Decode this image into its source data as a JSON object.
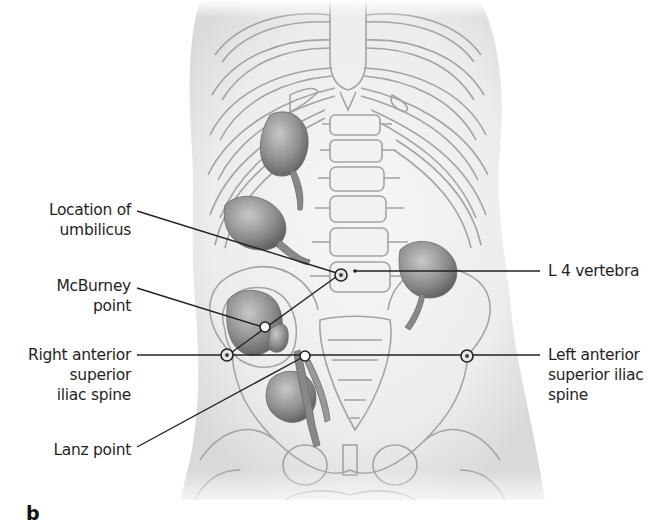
{
  "figure": {
    "panel_letter": "b",
    "labels_left": {
      "umbilicus": [
        "Location of",
        "umbilicus"
      ],
      "mcburney": [
        "McBurney",
        "point"
      ],
      "right_asis": [
        "Right anterior",
        "superior",
        "iliac spine"
      ],
      "lanz": [
        "Lanz point"
      ]
    },
    "labels_right": {
      "l4": [
        "L 4 vertebra"
      ],
      "left_asis": [
        "Left anterior",
        "superior iliac",
        "spine"
      ]
    },
    "colors": {
      "outline": "#9a9a9a",
      "body_shade": "#e6e6e6",
      "organ": "#8a8a8a",
      "leader_line": "#222222",
      "marker_fill": "#ffffff"
    }
  }
}
